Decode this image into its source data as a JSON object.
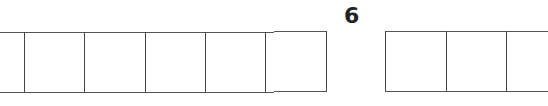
{
  "label": "6",
  "left_strip": {
    "top": 32,
    "bottom": 92,
    "left": 0,
    "right": 274,
    "dividers": [
      24,
      84,
      145,
      205,
      265
    ]
  },
  "right_strip": {
    "top": 31,
    "bottom": 91,
    "left": 385,
    "right": 548,
    "dividers": [
      446,
      506
    ]
  },
  "colors": {
    "line": "#555555",
    "text": "#222222",
    "background": "#ffffff"
  }
}
